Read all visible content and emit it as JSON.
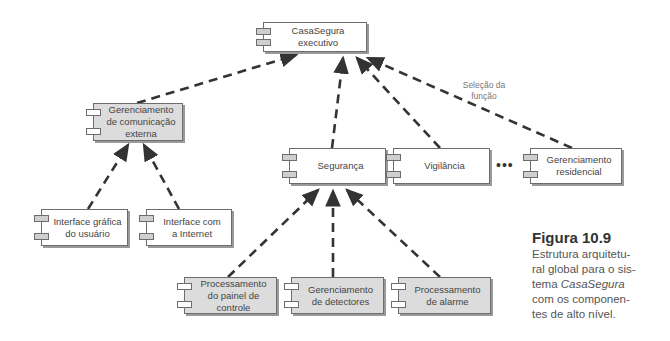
{
  "diagram": {
    "components": [
      {
        "id": "exec",
        "label": "CasaSegura executivo",
        "lines": [
          "CasaSegura",
          "executivo"
        ],
        "fill": "white"
      },
      {
        "id": "comext",
        "label": "Gerenciamento de comunicação externa",
        "lines": [
          "Gerenciamento",
          "de comunicação",
          "externa"
        ],
        "fill": "gray"
      },
      {
        "id": "seg",
        "label": "Segurança",
        "lines": [
          "Segurança"
        ],
        "fill": "white"
      },
      {
        "id": "vig",
        "label": "Vigilância",
        "lines": [
          "Vigilância"
        ],
        "fill": "white"
      },
      {
        "id": "res",
        "label": "Gerenciamento residencial",
        "lines": [
          "Gerenciamento",
          "residencial"
        ],
        "fill": "white"
      },
      {
        "id": "gui",
        "label": "Interface gráfica do usuário",
        "lines": [
          "Interface gráfica",
          "do usuário"
        ],
        "fill": "white"
      },
      {
        "id": "inet",
        "label": "Interface com a Internet",
        "lines": [
          "Interface com",
          "a Internet"
        ],
        "fill": "white"
      },
      {
        "id": "painel",
        "label": "Processamento do painel de controle",
        "lines": [
          "Processamento",
          "do painel de",
          "controle"
        ],
        "fill": "gray"
      },
      {
        "id": "detect",
        "label": "Gerenciamento de detectores",
        "lines": [
          "Gerenciamento",
          "de detectores"
        ],
        "fill": "gray"
      },
      {
        "id": "alarme",
        "label": "Processamento de alarme",
        "lines": [
          "Processamento",
          "de alarme"
        ],
        "fill": "gray"
      }
    ],
    "edges": [
      {
        "from": "comext",
        "to": "exec"
      },
      {
        "from": "seg",
        "to": "exec"
      },
      {
        "from": "vig",
        "to": "exec"
      },
      {
        "from": "res",
        "to": "exec",
        "label": "Seleção da função"
      },
      {
        "from": "gui",
        "to": "comext"
      },
      {
        "from": "inet",
        "to": "comext"
      },
      {
        "from": "painel",
        "to": "seg"
      },
      {
        "from": "detect",
        "to": "seg"
      },
      {
        "from": "alarme",
        "to": "seg"
      }
    ],
    "edge_label": [
      "Seleção da",
      "função"
    ],
    "ellipsis": "•••"
  },
  "caption": {
    "title": "Figura 10.9",
    "body_lines": [
      "Estrutura arquitetu-",
      "ral global para o sis-"
    ],
    "body_prefix": "tema ",
    "body_italic": "CasaSegura",
    "body_rest_lines": [
      "com os componen-",
      "tes de alto nível."
    ]
  }
}
